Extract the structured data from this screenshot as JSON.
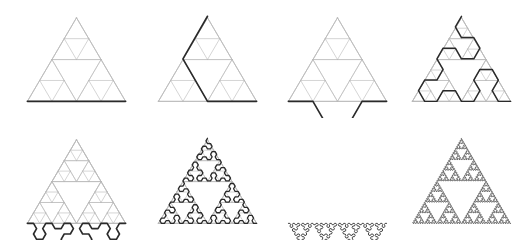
{
  "figure": {
    "background_color": "#ffffff",
    "width": 527,
    "height": 242,
    "rows": 2,
    "columns": 4
  },
  "style": {
    "grid_color": "#b9b9b9",
    "grid_width": 0.7,
    "curve_color": "#2a2a2a",
    "curve_widths": [
      1.9,
      1.9,
      1.9,
      1.7,
      1.9,
      1.5,
      1.0,
      0.8
    ]
  },
  "chart_data": {
    "type": "line",
    "xlabel": "",
    "ylabel": "",
    "series": [
      {
        "name": "stage-1",
        "order": 1,
        "segments": 1,
        "grid_depth": 2,
        "curve_width": 1.9,
        "label": "n = 1"
      },
      {
        "name": "stage-2",
        "order": 2,
        "segments": 3,
        "grid_depth": 2,
        "curve_width": 1.9,
        "label": "n = 2"
      },
      {
        "name": "stage-3",
        "order": 3,
        "segments": 9,
        "grid_depth": 2,
        "curve_width": 1.9,
        "label": "n = 3"
      },
      {
        "name": "stage-4",
        "order": 4,
        "segments": 27,
        "grid_depth": 3,
        "curve_width": 1.7,
        "label": "n = 4"
      },
      {
        "name": "stage-5",
        "order": 5,
        "segments": 81,
        "grid_depth": 3,
        "curve_width": 1.9,
        "label": "n = 5"
      },
      {
        "name": "stage-6",
        "order": 6,
        "segments": 243,
        "grid_depth": 3,
        "curve_width": 1.5,
        "label": "n = 6"
      },
      {
        "name": "stage-7",
        "order": 7,
        "segments": 729,
        "grid_depth": 0,
        "curve_width": 1.0,
        "label": "n = 7"
      },
      {
        "name": "stage-8",
        "order": 8,
        "segments": 2187,
        "grid_depth": 0,
        "curve_width": 0.8,
        "label": "n = 8"
      }
    ],
    "panel_layout": [
      {
        "index": 0,
        "left": 11,
        "top": 2,
        "width": 131,
        "height": 116,
        "apex_x": 76,
        "apex_y": 11,
        "base_left_x": 19,
        "base_right_x": 133,
        "base_y": 108
      },
      {
        "index": 1,
        "left": 142,
        "top": 2,
        "width": 131,
        "height": 116,
        "apex_x": 76,
        "apex_y": 11,
        "base_left_x": 19,
        "base_right_x": 133,
        "base_y": 108
      },
      {
        "index": 2,
        "left": 272,
        "top": 2,
        "width": 131,
        "height": 116,
        "apex_x": 76,
        "apex_y": 11,
        "base_left_x": 19,
        "base_right_x": 133,
        "base_y": 108
      },
      {
        "index": 3,
        "left": 396,
        "top": 2,
        "width": 131,
        "height": 116,
        "apex_x": 76,
        "apex_y": 11,
        "base_left_x": 19,
        "base_right_x": 133,
        "base_y": 108
      },
      {
        "index": 4,
        "left": 11,
        "top": 124,
        "width": 131,
        "height": 116,
        "apex_x": 76,
        "apex_y": 11,
        "base_left_x": 19,
        "base_right_x": 133,
        "base_y": 108
      },
      {
        "index": 5,
        "left": 142,
        "top": 124,
        "width": 131,
        "height": 116,
        "apex_x": 76,
        "apex_y": 11,
        "base_left_x": 19,
        "base_right_x": 133,
        "base_y": 108
      },
      {
        "index": 6,
        "left": 272,
        "top": 124,
        "width": 131,
        "height": 116,
        "apex_x": 76,
        "apex_y": 11,
        "base_left_x": 19,
        "base_right_x": 133,
        "base_y": 108
      },
      {
        "index": 7,
        "left": 396,
        "top": 124,
        "width": 131,
        "height": 116,
        "apex_x": 76,
        "apex_y": 11,
        "base_left_x": 19,
        "base_right_x": 133,
        "base_y": 108
      }
    ],
    "grid_on": true,
    "legend_position": "none"
  }
}
